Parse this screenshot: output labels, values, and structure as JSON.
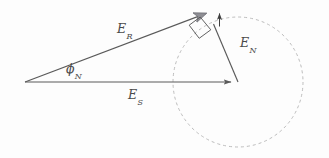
{
  "figure": {
    "type": "phasor-vector-diagram",
    "background_color": "#fdfdfd",
    "stroke_color": "#5a5a5a",
    "dashed_color": "#b4b4b4",
    "text_color": "#4a4a4a",
    "width": 329,
    "height": 158
  },
  "labels": {
    "resultant": {
      "symbol": "E",
      "subscript": "R",
      "full": "E_R"
    },
    "signal": {
      "symbol": "E",
      "subscript": "S",
      "full": "E_S"
    },
    "noise": {
      "symbol": "E",
      "subscript": "N",
      "full": "E_N"
    },
    "phase_angle": {
      "symbol": "ϕ",
      "subscript": "N",
      "full": "ϕ_N"
    }
  },
  "geometry": {
    "origin": {
      "x": 25,
      "y": 82
    },
    "signal_tip": {
      "x": 238,
      "y": 82
    },
    "resultant_tip": {
      "x": 215,
      "y": 10
    },
    "noise_tail": {
      "x": 238,
      "y": 82
    },
    "noise_head": {
      "x": 213,
      "y": 23
    },
    "small_arrow": {
      "x1": 219,
      "y1": 26,
      "x2": 219,
      "y2": 12
    },
    "right_angle_marker": {
      "size": 13
    },
    "circle": {
      "cx": 238,
      "cy": 82,
      "r": 65,
      "dash": "3 3"
    }
  },
  "annotations": {
    "right_angle": "right-angle-marker",
    "noise_circle": "dashed-noise-locus-circle"
  }
}
